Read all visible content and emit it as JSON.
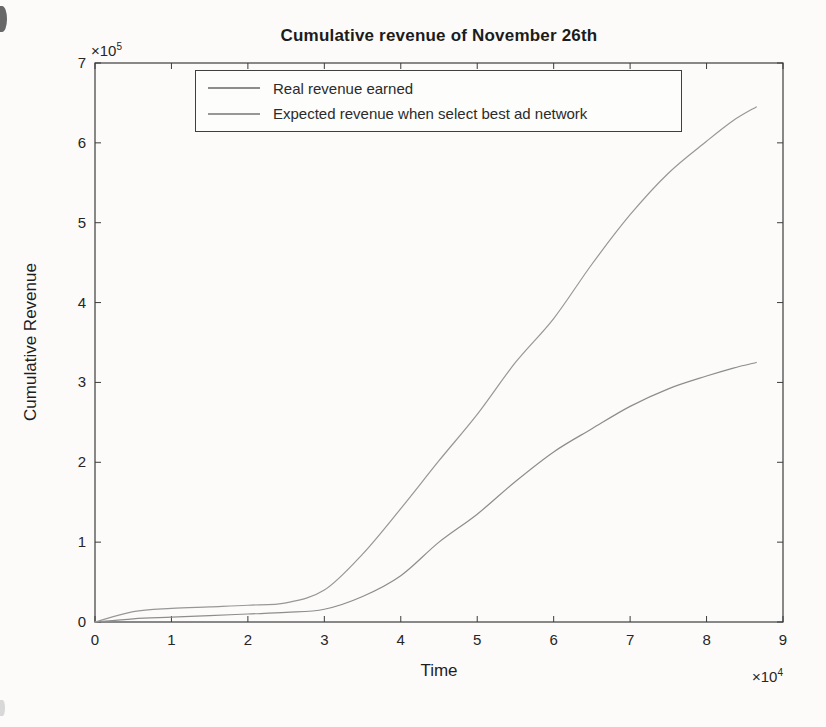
{
  "chart_data": {
    "type": "line",
    "title": "Cumulative revenue of November 26th",
    "xlabel": "Time",
    "ylabel": "Cumulative Revenue",
    "x_axis_exponent": {
      "prefix": "×10",
      "exponent": "4"
    },
    "y_axis_exponent": {
      "prefix": "×10",
      "exponent": "5"
    },
    "xlim": [
      0,
      9
    ],
    "ylim": [
      0,
      7
    ],
    "x_ticks": [
      "0",
      "1",
      "2",
      "3",
      "4",
      "5",
      "6",
      "7",
      "8",
      "9"
    ],
    "y_ticks": [
      "0",
      "1",
      "2",
      "3",
      "4",
      "5",
      "6",
      "7"
    ],
    "grid": false,
    "legend_position": "top-left-inside",
    "axis_color": "#3c3c3c",
    "background_color": "#fcfbfa",
    "series": [
      {
        "id": "real-revenue",
        "name": "Real revenue earned",
        "color": "#8d8d8d",
        "x": [
          0,
          0.5,
          1,
          1.5,
          2,
          2.5,
          3,
          3.5,
          4,
          4.5,
          5,
          5.5,
          6,
          6.5,
          7,
          7.5,
          8,
          8.35,
          8.65
        ],
        "y": [
          0,
          0.04,
          0.06,
          0.08,
          0.1,
          0.12,
          0.16,
          0.32,
          0.58,
          1.0,
          1.35,
          1.76,
          2.13,
          2.42,
          2.7,
          2.92,
          3.08,
          3.18,
          3.25
        ]
      },
      {
        "id": "expected-revenue",
        "name": "Expected revenue when select best ad network",
        "color": "#979797",
        "x": [
          0,
          0.5,
          1,
          1.5,
          2,
          2.5,
          3,
          3.5,
          4,
          4.5,
          5,
          5.5,
          6,
          6.5,
          7,
          7.5,
          8,
          8.35,
          8.65
        ],
        "y": [
          0,
          0.13,
          0.17,
          0.19,
          0.21,
          0.24,
          0.4,
          0.85,
          1.42,
          2.02,
          2.6,
          3.25,
          3.8,
          4.48,
          5.1,
          5.62,
          6.02,
          6.28,
          6.45
        ]
      }
    ]
  }
}
